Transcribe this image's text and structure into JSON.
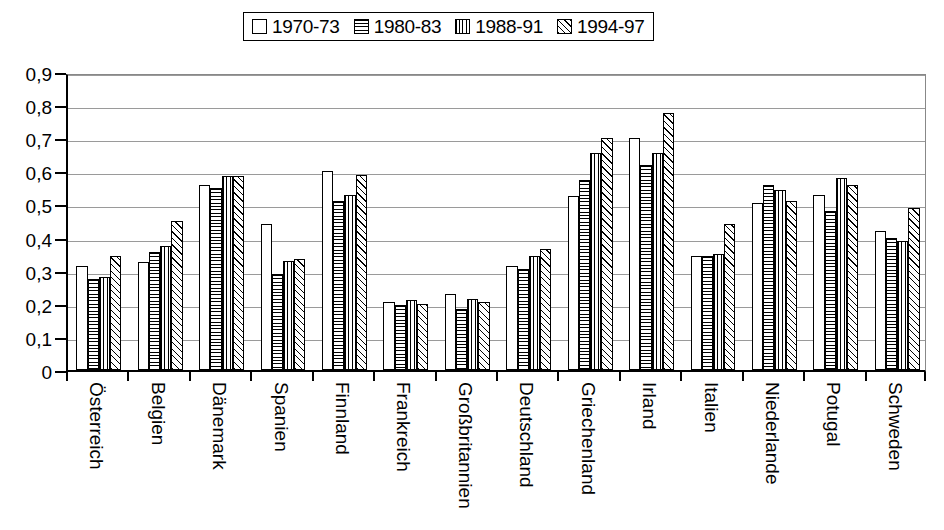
{
  "legend": {
    "entries": [
      {
        "label": "1970-73",
        "pattern": "empty"
      },
      {
        "label": "1980-83",
        "pattern": "horizontal-lines"
      },
      {
        "label": "1988-91",
        "pattern": "vertical-lines"
      },
      {
        "label": "1994-97",
        "pattern": "diagonal-hatch"
      }
    ]
  },
  "axis": {
    "y_tick_labels": [
      "0,9",
      "0,8",
      "0,7",
      "0,6",
      "0,5",
      "0,4",
      "0,3",
      "0,2",
      "0,1",
      "0"
    ]
  },
  "chart_data": {
    "type": "bar",
    "title": "",
    "xlabel": "",
    "ylabel": "",
    "ylim": [
      0,
      0.9
    ],
    "ytick_values": [
      0,
      0.1,
      0.2,
      0.3,
      0.4,
      0.5,
      0.6,
      0.7,
      0.8,
      0.9
    ],
    "grid": true,
    "legend_position": "top-center",
    "decimal_separator": ",",
    "categories": [
      "Österreich",
      "Belgien",
      "Dänemark",
      "Spanien",
      "Finnland",
      "Frankreich",
      "Großbritannien",
      "Deutschland",
      "Griechenland",
      "Irland",
      "Italien",
      "Niederlande",
      "Potugal",
      "Schweden"
    ],
    "series": [
      {
        "name": "1970-73",
        "values": [
          0.315,
          0.325,
          0.56,
          0.44,
          0.6,
          0.205,
          0.23,
          0.315,
          0.525,
          0.7,
          0.345,
          0.505,
          0.53,
          0.42
        ]
      },
      {
        "name": "1980-83",
        "values": [
          0.275,
          0.355,
          0.55,
          0.29,
          0.51,
          0.195,
          0.185,
          0.305,
          0.575,
          0.62,
          0.345,
          0.56,
          0.48,
          0.4
        ]
      },
      {
        "name": "1988-91",
        "values": [
          0.28,
          0.375,
          0.585,
          0.33,
          0.53,
          0.21,
          0.215,
          0.345,
          0.655,
          0.655,
          0.35,
          0.545,
          0.58,
          0.39
        ]
      },
      {
        "name": "1994-97",
        "values": [
          0.345,
          0.45,
          0.585,
          0.335,
          0.59,
          0.2,
          0.205,
          0.365,
          0.7,
          0.775,
          0.44,
          0.51,
          0.56,
          0.49
        ]
      }
    ]
  }
}
